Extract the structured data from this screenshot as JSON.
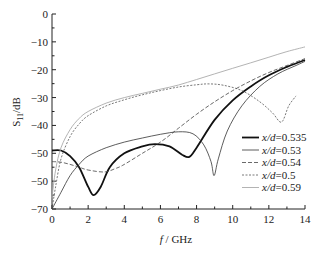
{
  "chart_data": {
    "type": "line",
    "title": "",
    "xlabel": "f / GHz",
    "ylabel": "S11/dB",
    "xlim": [
      0,
      14
    ],
    "ylim": [
      -70,
      0
    ],
    "x_ticks": [
      "0",
      "2",
      "4",
      "6",
      "8",
      "10",
      "12",
      "14"
    ],
    "y_ticks": [
      "0",
      "−10",
      "−20",
      "−30",
      "−40",
      "−50",
      "−50",
      "−70"
    ],
    "grid": false,
    "legend_position": "lower right",
    "series": [
      {
        "name": "x/d=0.535",
        "style": "thick-solid",
        "color": "#111111",
        "x": [
          0,
          0.5,
          1.0,
          1.5,
          2.0,
          2.3,
          2.7,
          3.2,
          4.0,
          5.0,
          5.7,
          6.5,
          7.2,
          7.6,
          8.0,
          9.0,
          10.0,
          11.0,
          12.0,
          13.0,
          14.0
        ],
        "y": [
          -49,
          -49,
          -51,
          -55,
          -62,
          -65,
          -62,
          -55,
          -50,
          -47.5,
          -46.7,
          -47.5,
          -50.5,
          -51.3,
          -48,
          -38,
          -31,
          -26,
          -22,
          -19,
          -16.5
        ]
      },
      {
        "name": "x/d=0.53",
        "style": "thin-solid",
        "color": "#333333",
        "x": [
          0,
          0.5,
          1.0,
          1.5,
          2.0,
          3.0,
          4.0,
          5.0,
          6.0,
          7.0,
          7.8,
          8.4,
          8.8,
          8.97,
          9.2,
          9.7,
          10.5,
          11.5,
          12.5,
          13.5,
          14.0
        ],
        "y": [
          -70,
          -64,
          -58,
          -54,
          -51,
          -48,
          -46,
          -44.5,
          -43.2,
          -42.3,
          -43,
          -47,
          -53,
          -58,
          -52,
          -42,
          -33,
          -26,
          -21.5,
          -18.5,
          -17
        ]
      },
      {
        "name": "x/d=0.54",
        "style": "dashed",
        "color": "#444444",
        "x": [
          0,
          0.5,
          1.0,
          1.5,
          2.0,
          2.9,
          3.5,
          4.0,
          5.0,
          6.0,
          7.0,
          8.0,
          9.0,
          10.0,
          11.0,
          12.0,
          13.0,
          14.0
        ],
        "y": [
          -53,
          -53.2,
          -54,
          -55,
          -56,
          -56.7,
          -55.5,
          -54,
          -50,
          -46,
          -41,
          -36,
          -31.5,
          -27.5,
          -24,
          -21,
          -18.5,
          -16
        ]
      },
      {
        "name": "x/d=0.5",
        "style": "dotted",
        "color": "#555555",
        "x": [
          0,
          0.2,
          0.5,
          1.0,
          1.5,
          2.0,
          3.0,
          4.0,
          5.0,
          6.0,
          7.0,
          8.0,
          8.7,
          9.5,
          10.5,
          11.5,
          12.2,
          12.7,
          13.1,
          13.5
        ],
        "y": [
          -70,
          -62,
          -52,
          -44,
          -39.5,
          -36.5,
          -33,
          -30.8,
          -29,
          -27.5,
          -26.2,
          -25.4,
          -25.1,
          -25.6,
          -27.5,
          -31.5,
          -35.5,
          -38.8,
          -33,
          -29.4
        ]
      },
      {
        "name": "x/d=0.59",
        "style": "light-solid",
        "color": "#aaaaaa",
        "x": [
          0,
          0.2,
          0.5,
          1.0,
          1.5,
          2.0,
          3.0,
          4.0,
          5.0,
          6.0,
          7.0,
          8.0,
          9.0,
          10.0,
          11.0,
          12.0,
          13.0,
          14.0
        ],
        "y": [
          -66,
          -56,
          -48,
          -41.5,
          -37.5,
          -35,
          -32,
          -30,
          -28.5,
          -27,
          -25.5,
          -23.5,
          -21.5,
          -19.5,
          -17.5,
          -15.5,
          -13.5,
          -11.8
        ]
      }
    ]
  },
  "legend": {
    "items": [
      {
        "label": "x/d=0.535",
        "style": "thick-solid"
      },
      {
        "label": "x/d=0.53",
        "style": "thin-solid"
      },
      {
        "label": "x/d=0.54",
        "style": "dashed"
      },
      {
        "label": "x/d=0.5",
        "style": "dotted"
      },
      {
        "label": "x/d=0.59",
        "style": "light-solid"
      }
    ]
  },
  "axes": {
    "xlabel_italic": "f",
    "xlabel_rest": " / GHz",
    "ylabel_main": "S",
    "ylabel_sub": "11",
    "ylabel_rest": "/dB"
  }
}
